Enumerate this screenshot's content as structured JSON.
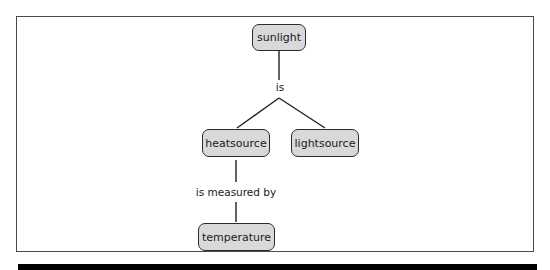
{
  "diagram": {
    "type": "concept-map",
    "nodes": [
      {
        "id": "sunlight",
        "label": "sunlight"
      },
      {
        "id": "heatsource",
        "label": "heatsource"
      },
      {
        "id": "lightsource",
        "label": "lightsource"
      },
      {
        "id": "temperature",
        "label": "temperature"
      }
    ],
    "links": [
      {
        "from": "sunlight",
        "to": [
          "heatsource",
          "lightsource"
        ],
        "label": "is"
      },
      {
        "from": "heatsource",
        "to": [
          "temperature"
        ],
        "label": "is measured by"
      }
    ]
  },
  "colors": {
    "node_fill": "#d9d9d9",
    "node_border": "#2b2b2b",
    "frame_border": "#4a4a4a",
    "bottom_bar": "#000000"
  }
}
